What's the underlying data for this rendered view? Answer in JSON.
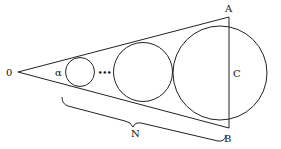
{
  "diagram": {
    "labels": {
      "apex": "0",
      "angle": "α",
      "ellipsis": "•••",
      "top_point": "A",
      "bottom_point": "B",
      "chord": "C",
      "count": "N"
    },
    "elements": [
      "apex 0",
      "two cone boundary lines",
      "small circle",
      "ellipsis dots",
      "medium circle",
      "large circle",
      "chord AB",
      "brace under circles labeled N"
    ],
    "colors": {
      "line": "#222222",
      "text": "#111111",
      "background": "#ffffff"
    }
  }
}
